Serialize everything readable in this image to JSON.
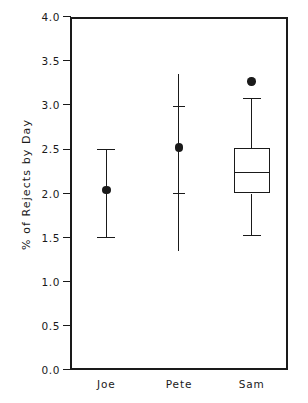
{
  "chart_data": {
    "type": "box",
    "title": "",
    "subtitle": "",
    "xlabel": "",
    "ylabel": "% of Rejects by Day",
    "categories": [
      "Joe",
      "Pete",
      "Sam"
    ],
    "ylim": [
      0.0,
      4.0
    ],
    "xlim": [
      0,
      3
    ],
    "grid": false,
    "legend": null,
    "ytick_labels": [
      "0.0",
      "0.5",
      "1.0",
      "1.5",
      "2.0",
      "2.5",
      "3.0",
      "3.5",
      "4.0"
    ],
    "ytick_values": [
      0.0,
      0.5,
      1.0,
      1.5,
      2.0,
      2.5,
      3.0,
      3.5,
      4.0
    ],
    "xtick_labels": [
      "Joe",
      "Pete",
      "Sam"
    ],
    "series": [
      {
        "name": "Joe",
        "style": "error-bar",
        "mean": 2.04,
        "upper": 2.5,
        "lower": 1.5,
        "caps": [
          2.5,
          1.5
        ],
        "marker": "filled-circle"
      },
      {
        "name": "Pete",
        "style": "range-line",
        "mean": 2.52,
        "upper": 3.35,
        "lower": 1.35,
        "caps": [
          2.98,
          2.0
        ],
        "marker": "filled-circle"
      },
      {
        "name": "Sam",
        "style": "box-plot",
        "whisker_high": 3.07,
        "q3": 2.51,
        "median": 2.24,
        "q1": 2.0,
        "whisker_low": 1.52,
        "outliers": [
          3.27
        ],
        "marker": "filled-circle"
      }
    ],
    "colors": {
      "ink": "#1a1a1a",
      "background": "#ffffff"
    }
  }
}
